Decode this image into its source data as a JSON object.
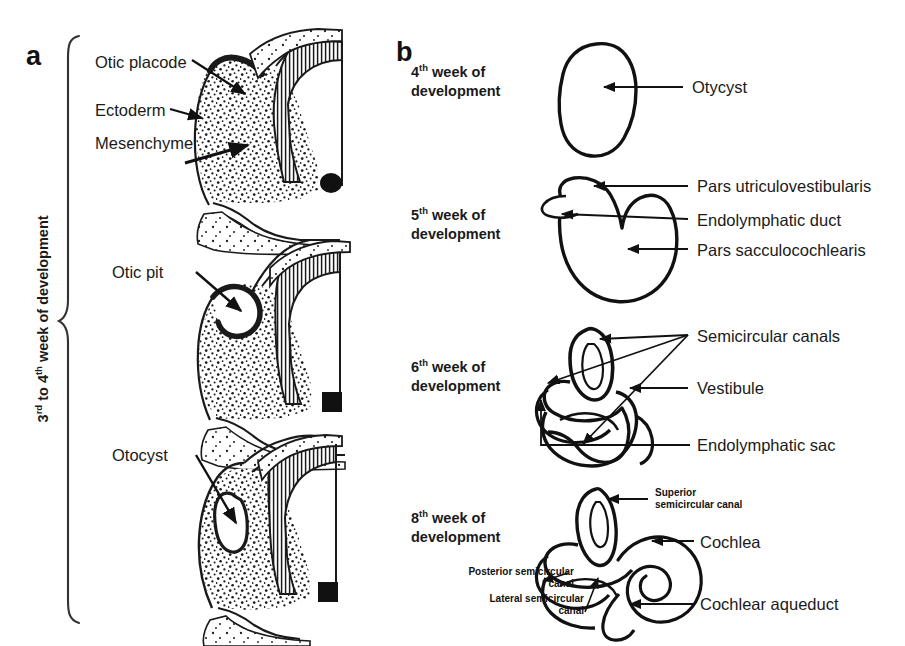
{
  "figure": {
    "background_color": "#ffffff",
    "ink_color": "#1a1a1a"
  },
  "panel_a": {
    "letter": "a",
    "side_label": {
      "text": "3rd to 4th week of development",
      "prefix1": "3",
      "sup1": "rd",
      "mid": " to 4",
      "sup2": "th",
      "suffix": " week of development"
    },
    "stages": [
      {
        "name": "otic-placode-stage",
        "labels": [
          "Otic placode",
          "Ectoderm",
          "Mesenchyme"
        ]
      },
      {
        "name": "otic-pit-stage",
        "labels": [
          "Otic pit"
        ]
      },
      {
        "name": "otocyst-stage",
        "labels": [
          "Otocyst"
        ]
      }
    ],
    "callouts": {
      "otic_placode": "Otic placode",
      "ectoderm": "Ectoderm",
      "mesenchyme": "Mesenchyme",
      "otic_pit": "Otic pit",
      "otocyst": "Otocyst"
    }
  },
  "panel_b": {
    "letter": "b",
    "stages": [
      {
        "name": "week-4",
        "week_num": "4",
        "week_sup": "th",
        "week_line1": " week of",
        "week_line2": "development",
        "callouts": [
          "Otycyst"
        ]
      },
      {
        "name": "week-5",
        "week_num": "5",
        "week_sup": "th",
        "week_line1": " week of",
        "week_line2": "development",
        "callouts": [
          "Pars utriculovestibularis",
          "Endolymphatic duct",
          "Pars sacculocochlearis"
        ]
      },
      {
        "name": "week-6",
        "week_num": "6",
        "week_sup": "th",
        "week_line1": " week of",
        "week_line2": "development",
        "callouts": [
          "Semicircular canals",
          "Vestibule",
          "Endolymphatic sac"
        ]
      },
      {
        "name": "week-8",
        "week_num": "8",
        "week_sup": "th",
        "week_line1": " week of",
        "week_line2": "development",
        "callouts": [
          "Superior semicircular canal",
          "Cochlea",
          "Cochlear aqueduct",
          "Posterior semicircular canal",
          "Lateral semicircular canal"
        ]
      }
    ],
    "callouts": {
      "otycyst": "Otycyst",
      "pars_utriculovestibularis": "Pars utriculovestibularis",
      "endolymphatic_duct": "Endolymphatic duct",
      "pars_sacculocochlearis": "Pars sacculocochlearis",
      "semicircular_canals": "Semicircular canals",
      "vestibule": "Vestibule",
      "endolymphatic_sac": "Endolymphatic sac",
      "superior_semicircular_canal_l1": "Superior",
      "superior_semicircular_canal_l2": "semicircular canal",
      "cochlea": "Cochlea",
      "cochlear_aqueduct": "Cochlear aqueduct",
      "posterior_semicircular_canal_l1": "Posterior semicircular",
      "posterior_semicircular_canal_l2": "canal",
      "lateral_semicircular_canal_l1": "Lateral semicircular",
      "lateral_semicircular_canal_l2": "canal"
    }
  }
}
